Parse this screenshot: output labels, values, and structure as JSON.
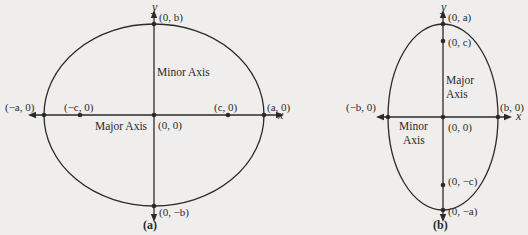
{
  "figure_a": {
    "caption": "(a)",
    "x_axis_label": "x",
    "y_axis_label": "y",
    "points": {
      "neg_a": "(−a, 0)",
      "neg_c": "(−c, 0)",
      "c": "(c, 0)",
      "a": "(a, 0)",
      "b": "(0, b)",
      "neg_b": "(0, −b)",
      "origin": "(0, 0)"
    },
    "major_axis_label": "Major Axis",
    "minor_axis_label": "Minor Axis"
  },
  "figure_b": {
    "caption": "(b)",
    "x_axis_label": "x",
    "y_axis_label": "y",
    "points": {
      "a": "(0, a)",
      "c": "(0, c)",
      "neg_c": "(0, −c)",
      "neg_a": "(0, −a)",
      "neg_b": "(−b, 0)",
      "b": "(b, 0)",
      "origin": "(0, 0)"
    },
    "major_axis_label_line1": "Major",
    "major_axis_label_line2": "Axis",
    "minor_axis_label_line1": "Minor",
    "minor_axis_label_line2": "Axis"
  },
  "colors": {
    "background": "#efeeec",
    "stroke": "#2a2a2a"
  }
}
